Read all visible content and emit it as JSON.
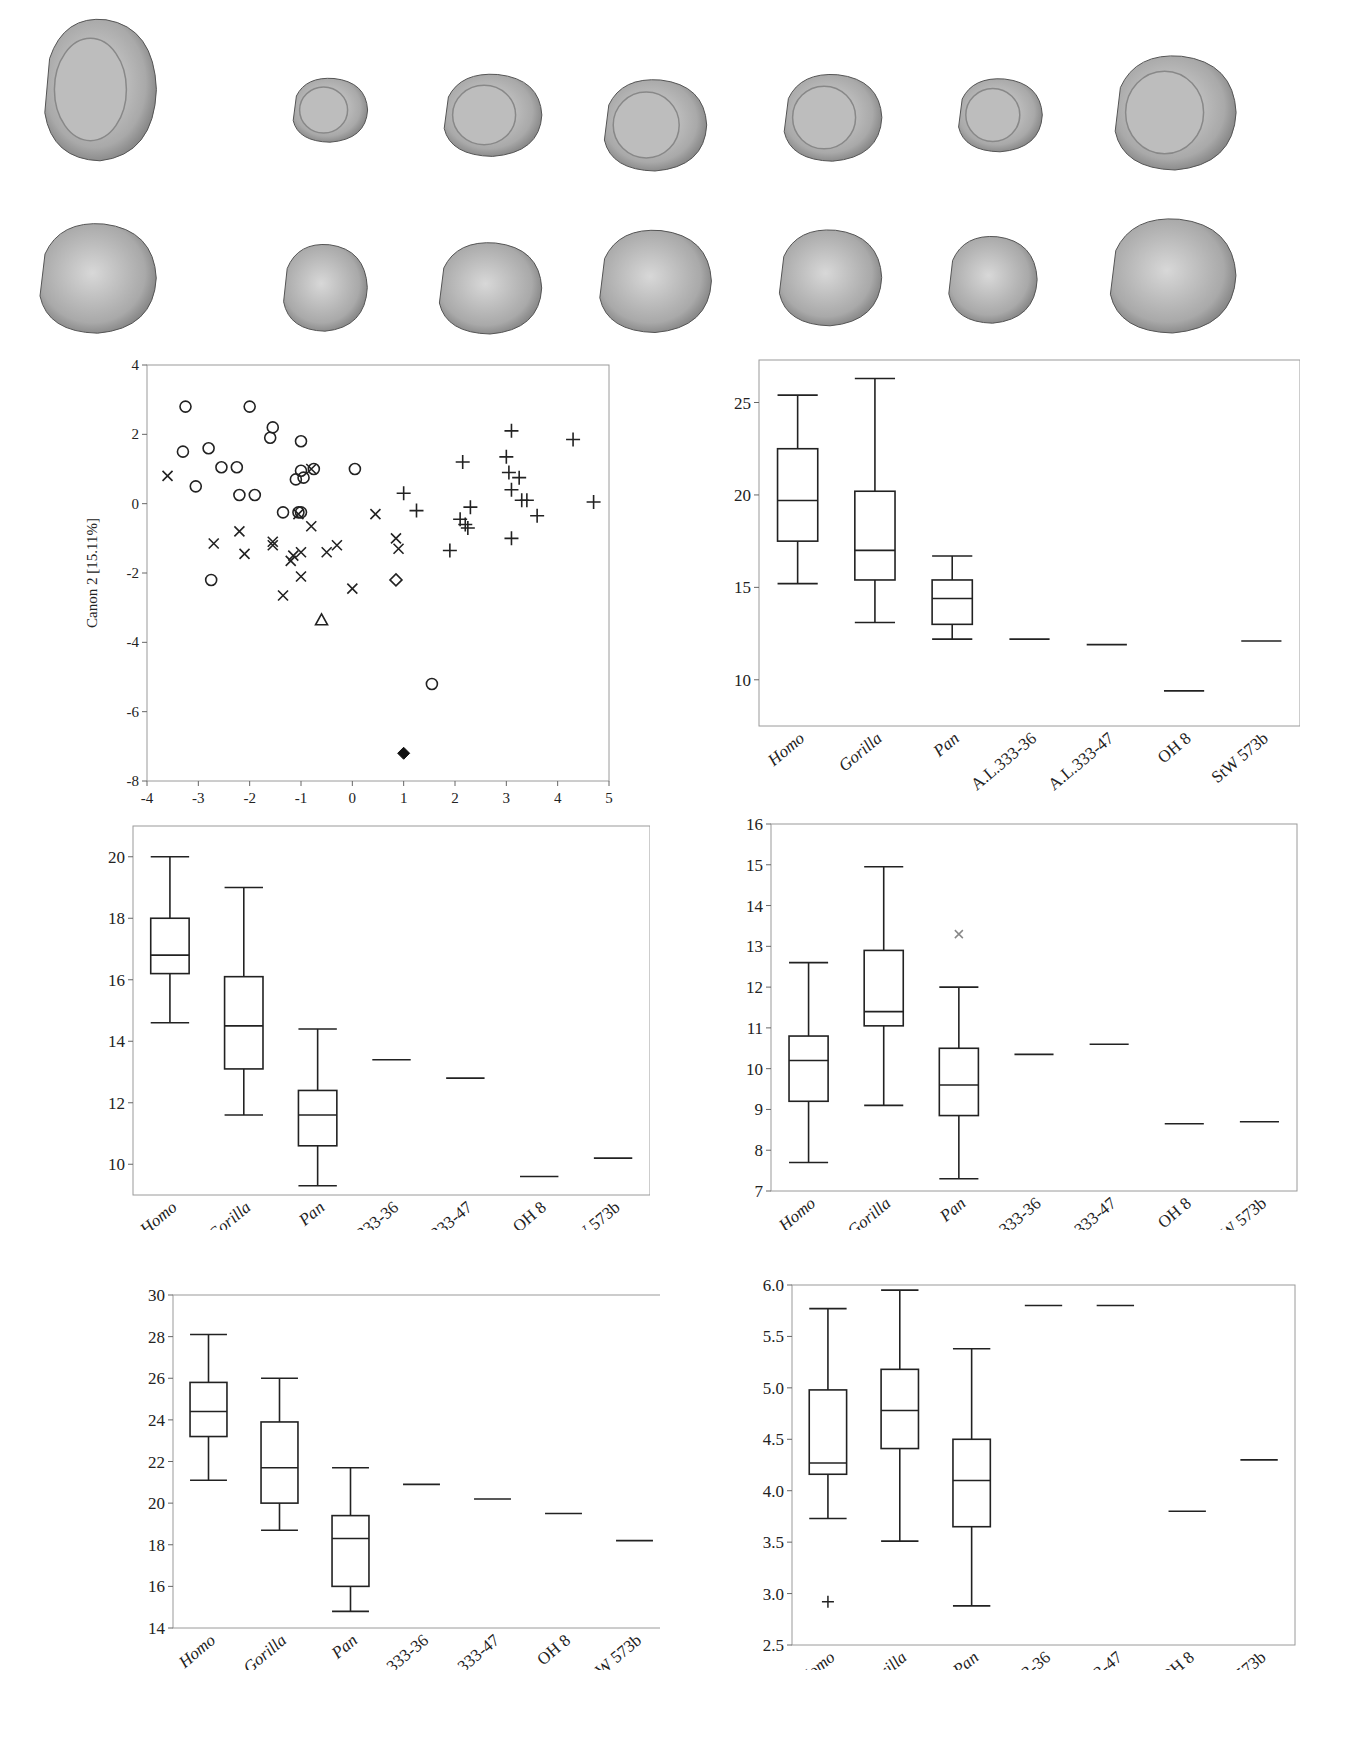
{
  "figure": {
    "bone_rows": [
      {
        "view": "articular",
        "items": [
          {
            "x": 40,
            "y": 12,
            "w": 120,
            "h": 155
          },
          {
            "x": 290,
            "y": 75,
            "w": 80,
            "h": 70
          },
          {
            "x": 440,
            "y": 70,
            "w": 105,
            "h": 90
          },
          {
            "x": 600,
            "y": 75,
            "w": 110,
            "h": 100
          },
          {
            "x": 780,
            "y": 70,
            "w": 105,
            "h": 95
          },
          {
            "x": 955,
            "y": 75,
            "w": 90,
            "h": 80
          },
          {
            "x": 1110,
            "y": 50,
            "w": 130,
            "h": 125
          }
        ]
      },
      {
        "view": "lateral",
        "items": [
          {
            "x": 35,
            "y": 218,
            "w": 125,
            "h": 120
          },
          {
            "x": 280,
            "y": 240,
            "w": 90,
            "h": 95
          },
          {
            "x": 435,
            "y": 238,
            "w": 110,
            "h": 100
          },
          {
            "x": 595,
            "y": 225,
            "w": 120,
            "h": 112
          },
          {
            "x": 775,
            "y": 225,
            "w": 110,
            "h": 105
          },
          {
            "x": 945,
            "y": 232,
            "w": 95,
            "h": 95
          },
          {
            "x": 1105,
            "y": 213,
            "w": 135,
            "h": 125
          }
        ]
      }
    ]
  },
  "chart_data": [
    {
      "id": "scatter",
      "type": "scatter",
      "title": "",
      "xlabel": "",
      "ylabel": "Canon 2 [15.11%]",
      "xlim": [
        -4,
        5
      ],
      "ylim": [
        -8,
        4
      ],
      "xticks": [
        "-4",
        "-3",
        "-2",
        "-1",
        "0",
        "1",
        "2",
        "3",
        "4",
        "5"
      ],
      "yticks": [
        "4",
        "2",
        "0",
        "-2",
        "-4",
        "-6",
        "-8"
      ],
      "grid": false,
      "legend": null,
      "series": [
        {
          "name": "circle",
          "marker": "circle",
          "points": [
            [
              -3.25,
              2.8
            ],
            [
              -3.3,
              1.5
            ],
            [
              -3.05,
              0.5
            ],
            [
              -2.8,
              1.6
            ],
            [
              -2.55,
              1.05
            ],
            [
              -2.25,
              1.05
            ],
            [
              -2.2,
              0.25
            ],
            [
              -2.0,
              2.8
            ],
            [
              -1.9,
              0.25
            ],
            [
              -1.6,
              1.9
            ],
            [
              -1.55,
              2.2
            ],
            [
              -1.35,
              -0.25
            ],
            [
              -1.0,
              1.8
            ],
            [
              -1.0,
              0.95
            ],
            [
              -0.95,
              0.75
            ],
            [
              -1.1,
              0.7
            ],
            [
              -0.75,
              1.0
            ],
            [
              -1.05,
              -0.25
            ],
            [
              -1.0,
              -0.25
            ],
            [
              0.05,
              1.0
            ],
            [
              -2.75,
              -2.2
            ],
            [
              1.55,
              -5.2
            ]
          ]
        },
        {
          "name": "x",
          "marker": "x",
          "points": [
            [
              -3.6,
              0.8
            ],
            [
              -2.7,
              -1.15
            ],
            [
              -2.2,
              -0.8
            ],
            [
              -2.1,
              -1.45
            ],
            [
              -1.55,
              -1.1
            ],
            [
              -1.55,
              -1.2
            ],
            [
              -1.35,
              -2.65
            ],
            [
              -1.2,
              -1.65
            ],
            [
              -1.15,
              -1.5
            ],
            [
              -1.0,
              -1.4
            ],
            [
              -1.0,
              -2.1
            ],
            [
              -1.05,
              -0.3
            ],
            [
              -0.8,
              -0.65
            ],
            [
              -0.5,
              -1.4
            ],
            [
              -0.3,
              -1.2
            ],
            [
              0.0,
              -2.45
            ],
            [
              0.45,
              -0.3
            ],
            [
              0.85,
              -1.0
            ],
            [
              0.9,
              -1.3
            ],
            [
              -0.8,
              1.0
            ]
          ]
        },
        {
          "name": "plus",
          "marker": "plus",
          "points": [
            [
              1.0,
              0.3
            ],
            [
              1.25,
              -0.2
            ],
            [
              1.9,
              -1.35
            ],
            [
              2.15,
              1.2
            ],
            [
              2.1,
              -0.45
            ],
            [
              2.2,
              -0.6
            ],
            [
              2.25,
              -0.7
            ],
            [
              2.3,
              -0.1
            ],
            [
              3.0,
              1.35
            ],
            [
              3.05,
              0.9
            ],
            [
              3.1,
              2.1
            ],
            [
              3.1,
              0.4
            ],
            [
              3.25,
              0.75
            ],
            [
              3.3,
              0.1
            ],
            [
              3.4,
              0.1
            ],
            [
              3.6,
              -0.35
            ],
            [
              3.1,
              -1.0
            ],
            [
              4.3,
              1.85
            ],
            [
              4.7,
              0.05
            ]
          ]
        },
        {
          "name": "triangle",
          "marker": "triangle",
          "points": [
            [
              -0.6,
              -3.35
            ]
          ]
        },
        {
          "name": "diamond-open",
          "marker": "diamond-open",
          "points": [
            [
              0.85,
              -2.2
            ]
          ]
        },
        {
          "name": "diamond-filled",
          "marker": "diamond-filled",
          "points": [
            [
              1.0,
              -7.2
            ]
          ]
        }
      ]
    },
    {
      "id": "box1",
      "type": "box",
      "categories": [
        "Homo",
        "Gorilla",
        "Pan",
        "A.L.333-36",
        "A.L.333-47",
        "OH 8",
        "StW 573b"
      ],
      "ylim": [
        7.5,
        27.3
      ],
      "yticks": [
        "10",
        "15",
        "20",
        "25"
      ],
      "boxes": [
        {
          "min": 15.2,
          "q1": 17.5,
          "median": 19.7,
          "q3": 22.5,
          "max": 25.4
        },
        {
          "min": 13.1,
          "q1": 15.4,
          "median": 17.0,
          "q3": 20.2,
          "max": 26.3
        },
        {
          "min": 12.2,
          "q1": 13.0,
          "median": 14.4,
          "q3": 15.4,
          "max": 16.7
        },
        {
          "value": 12.2
        },
        {
          "value": 11.9
        },
        {
          "value": 9.4
        },
        {
          "value": 12.1
        }
      ]
    },
    {
      "id": "box2",
      "type": "box",
      "categories": [
        "Homo",
        "Gorilla",
        "Pan",
        "A.L.333-36",
        "A.L.333-47",
        "OH 8",
        "StW 573b"
      ],
      "ylim": [
        9.0,
        21.0
      ],
      "yticks": [
        "10",
        "12",
        "14",
        "16",
        "18",
        "20"
      ],
      "boxes": [
        {
          "min": 14.6,
          "q1": 16.2,
          "median": 16.8,
          "q3": 18.0,
          "max": 20.0
        },
        {
          "min": 11.6,
          "q1": 13.1,
          "median": 14.5,
          "q3": 16.1,
          "max": 19.0
        },
        {
          "min": 9.3,
          "q1": 10.6,
          "median": 11.6,
          "q3": 12.4,
          "max": 14.4
        },
        {
          "value": 13.4
        },
        {
          "value": 12.8
        },
        {
          "value": 9.6
        },
        {
          "value": 10.2
        }
      ]
    },
    {
      "id": "box3",
      "type": "box",
      "categories": [
        "Homo",
        "Gorilla",
        "Pan",
        "A.L.333-36",
        "A.L.333-47",
        "OH 8",
        "StW 573b"
      ],
      "ylim": [
        7,
        16
      ],
      "yticks": [
        "7",
        "8",
        "9",
        "10",
        "11",
        "12",
        "13",
        "14",
        "15",
        "16"
      ],
      "boxes": [
        {
          "min": 7.7,
          "q1": 9.2,
          "median": 10.2,
          "q3": 10.8,
          "max": 12.6
        },
        {
          "min": 9.1,
          "q1": 11.05,
          "median": 11.4,
          "q3": 12.9,
          "max": 14.95
        },
        {
          "min": 7.3,
          "q1": 8.85,
          "median": 9.6,
          "q3": 10.5,
          "max": 12.0,
          "outliers": [
            13.3
          ]
        },
        {
          "value": 10.35
        },
        {
          "value": 10.6
        },
        {
          "value": 8.65
        },
        {
          "value": 8.7
        }
      ]
    },
    {
      "id": "box4",
      "type": "box",
      "categories": [
        "Homo",
        "Gorilla",
        "Pan",
        "A.L.333-36",
        "A.L.333-47",
        "OH 8",
        "StW 573b"
      ],
      "ylim": [
        14,
        30
      ],
      "yticks": [
        "14",
        "16",
        "18",
        "20",
        "22",
        "24",
        "26",
        "28",
        "30"
      ],
      "boxes": [
        {
          "min": 21.1,
          "q1": 23.2,
          "median": 24.4,
          "q3": 25.8,
          "max": 28.1
        },
        {
          "min": 18.7,
          "q1": 20.0,
          "median": 21.7,
          "q3": 23.9,
          "max": 26.0
        },
        {
          "min": 14.8,
          "q1": 16.0,
          "median": 18.3,
          "q3": 19.4,
          "max": 21.7
        },
        {
          "value": 20.9
        },
        {
          "value": 20.2
        },
        {
          "value": 19.5
        },
        {
          "value": 18.2
        }
      ]
    },
    {
      "id": "box5",
      "type": "box",
      "categories": [
        "Homo",
        "Gorilla",
        "Pan",
        "A.L.333-36",
        "A.L.333-47",
        "OH 8",
        "StW 573b"
      ],
      "ylim": [
        2.5,
        6.0
      ],
      "yticks": [
        "2.5",
        "3.0",
        "3.5",
        "4.0",
        "4.5",
        "5.0",
        "5.5",
        "6.0"
      ],
      "boxes": [
        {
          "min": 3.73,
          "q1": 4.16,
          "median": 4.27,
          "q3": 4.98,
          "max": 5.77,
          "outliers": [
            2.92
          ]
        },
        {
          "min": 3.51,
          "q1": 4.41,
          "median": 4.78,
          "q3": 5.18,
          "max": 5.95
        },
        {
          "min": 2.88,
          "q1": 3.65,
          "median": 4.1,
          "q3": 4.5,
          "max": 5.38
        },
        {
          "value": 5.8
        },
        {
          "value": 5.8
        },
        {
          "value": 3.8
        },
        {
          "value": 4.3
        }
      ]
    }
  ],
  "layout": {
    "scatter": {
      "left": 60,
      "top": 355,
      "width": 570,
      "height": 450,
      "plot": {
        "x": 87,
        "y": 10,
        "w": 462,
        "h": 416
      }
    },
    "box1": {
      "left": 680,
      "top": 355,
      "width": 620,
      "height": 470,
      "plot": {
        "x": 79,
        "y": 5,
        "w": 541,
        "h": 366
      }
    },
    "box2": {
      "left": 60,
      "top": 810,
      "width": 590,
      "height": 420,
      "plot": {
        "x": 73,
        "y": 16,
        "w": 517,
        "h": 369
      }
    },
    "box3": {
      "left": 660,
      "top": 810,
      "width": 650,
      "height": 420,
      "plot": {
        "x": 111,
        "y": 14,
        "w": 526,
        "h": 367
      }
    },
    "box4": {
      "left": 60,
      "top": 1230,
      "width": 600,
      "height": 440,
      "plot": {
        "x": 113,
        "y": 65,
        "w": 497,
        "h": 333
      }
    },
    "box5": {
      "left": 660,
      "top": 1230,
      "width": 650,
      "height": 440,
      "plot": {
        "x": 132,
        "y": 55,
        "w": 503,
        "h": 360
      }
    }
  }
}
